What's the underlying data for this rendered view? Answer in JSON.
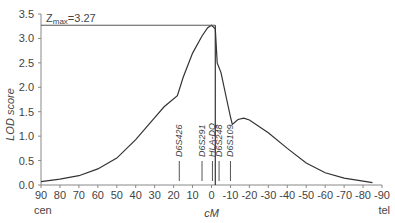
{
  "chart_data": {
    "type": "line",
    "title": "",
    "xlabel": "cM",
    "ylabel": "LOD score",
    "xlim": [
      90,
      -90
    ],
    "ylim": [
      0,
      3.5
    ],
    "grid": false,
    "x_ticks": [
      90,
      80,
      70,
      60,
      50,
      40,
      30,
      20,
      10,
      0,
      -10,
      -20,
      -30,
      -40,
      -50,
      -60,
      -70,
      -80,
      -90
    ],
    "y_ticks": [
      0.0,
      0.5,
      1.0,
      1.5,
      2.0,
      2.5,
      3.0,
      3.5
    ],
    "x_end_labels": {
      "left": "cen",
      "right": "tel"
    },
    "annotation": {
      "text": "Z",
      "subscript": "max",
      "suffix": "=3.27",
      "value": 3.27,
      "x": -2
    },
    "series": [
      {
        "name": "LOD score",
        "x": [
          90,
          80,
          70,
          60,
          50,
          40,
          30,
          25,
          18,
          15,
          10,
          5,
          2,
          0,
          -2,
          -3,
          -5,
          -8,
          -10,
          -11,
          -14,
          -17,
          -20,
          -30,
          -40,
          -50,
          -60,
          -70,
          -80,
          -85
        ],
        "y": [
          0.07,
          0.12,
          0.19,
          0.33,
          0.55,
          0.93,
          1.38,
          1.6,
          1.83,
          2.2,
          2.7,
          3.05,
          3.22,
          3.27,
          3.2,
          2.5,
          2.3,
          1.75,
          1.4,
          1.24,
          1.34,
          1.37,
          1.33,
          1.07,
          0.75,
          0.45,
          0.25,
          0.14,
          0.08,
          0.05
        ]
      }
    ],
    "markers": [
      {
        "label": "D6S426",
        "x": 17
      },
      {
        "label": "D6S291",
        "x": 5
      },
      {
        "label": "HLA-DQ",
        "x": -0.5
      },
      {
        "label": "D6S248",
        "x": -4
      },
      {
        "label": "D6S109",
        "x": -10
      }
    ]
  }
}
